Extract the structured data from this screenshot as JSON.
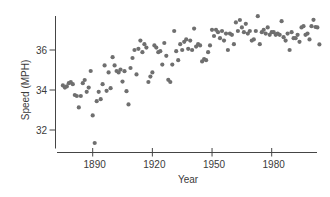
{
  "chart_data": {
    "type": "scatter",
    "title": "",
    "xlabel": "Year",
    "ylabel": "Speed (MPH)",
    "x_ticks": [
      1890,
      1920,
      1950,
      1980
    ],
    "y_ticks": [
      32,
      34,
      36
    ],
    "xlim": [
      1872,
      2005
    ],
    "ylim": [
      31,
      38
    ],
    "grid": false,
    "legend": "none",
    "colors": {
      "point": "#6f6f6f",
      "axis": "#454545",
      "text": "#3b3b3b",
      "background": "#ffffff"
    },
    "series": [
      {
        "name": "winning-speed",
        "x": [
          1875,
          1876,
          1877,
          1878,
          1879,
          1880,
          1881,
          1882,
          1883,
          1884,
          1885,
          1886,
          1887,
          1888,
          1889,
          1890,
          1891,
          1892,
          1893,
          1894,
          1895,
          1896,
          1897,
          1898,
          1899,
          1900,
          1901,
          1902,
          1903,
          1904,
          1905,
          1906,
          1907,
          1908,
          1909,
          1910,
          1911,
          1912,
          1913,
          1914,
          1915,
          1916,
          1917,
          1918,
          1919,
          1920,
          1921,
          1922,
          1923,
          1924,
          1925,
          1926,
          1927,
          1928,
          1929,
          1930,
          1931,
          1932,
          1933,
          1934,
          1935,
          1936,
          1937,
          1938,
          1939,
          1940,
          1941,
          1942,
          1943,
          1944,
          1945,
          1946,
          1947,
          1948,
          1949,
          1950,
          1951,
          1952,
          1953,
          1954,
          1955,
          1956,
          1957,
          1958,
          1959,
          1960,
          1961,
          1962,
          1963,
          1964,
          1965,
          1966,
          1967,
          1968,
          1969,
          1970,
          1971,
          1972,
          1973,
          1974,
          1975,
          1976,
          1977,
          1978,
          1979,
          1980,
          1981,
          1982,
          1983,
          1984,
          1985,
          1986,
          1987,
          1988,
          1989,
          1990,
          1991,
          1992,
          1993,
          1994,
          1995,
          1996,
          1997,
          1998,
          1999,
          2000,
          2001,
          2002,
          2003,
          2004
        ],
        "y": [
          34.23,
          34.12,
          34.18,
          34.34,
          34.39,
          34.29,
          33.75,
          33.7,
          33.13,
          33.7,
          34.34,
          34.5,
          33.91,
          34.12,
          34.95,
          32.73,
          31.35,
          33.44,
          33.91,
          33.54,
          34.29,
          35.23,
          33.96,
          34.88,
          34.09,
          35.64,
          35.23,
          34.95,
          34.88,
          35.02,
          34.42,
          34.94,
          33.94,
          33.28,
          35.1,
          35.6,
          36.0,
          34.78,
          36.06,
          36.47,
          35.89,
          36.29,
          36.12,
          34.4,
          34.67,
          34.88,
          36.23,
          36.12,
          35.89,
          35.94,
          35.27,
          36.35,
          35.71,
          34.51,
          34.4,
          35.27,
          36.95,
          35.94,
          35.49,
          36.29,
          36.0,
          36.41,
          36.53,
          36.06,
          36.47,
          36.0,
          37.07,
          36.17,
          36.29,
          36.23,
          35.43,
          35.55,
          35.49,
          35.89,
          36.23,
          37.01,
          36.7,
          37.01,
          36.89,
          36.59,
          36.95,
          36.47,
          36.82,
          36.0,
          36.82,
          36.76,
          36.29,
          37.38,
          36.95,
          37.5,
          37.13,
          36.89,
          37.31,
          36.82,
          36.95,
          36.47,
          36.53,
          36.95,
          37.69,
          36.29,
          36.89,
          37.01,
          36.82,
          37.13,
          36.76,
          36.89,
          36.89,
          36.76,
          36.82,
          36.76,
          37.44,
          36.64,
          36.47,
          36.82,
          36.0,
          36.89,
          36.59,
          36.59,
          36.76,
          36.41,
          37.13,
          37.19,
          36.76,
          36.82,
          36.53,
          37.19,
          37.51,
          37.15,
          37.13,
          36.28
        ]
      }
    ]
  }
}
